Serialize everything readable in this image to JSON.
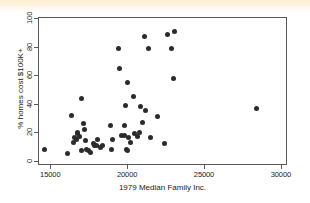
{
  "figure": {
    "background_color": "#ffffff",
    "frame_color": "#585858",
    "point_color": "#2b2b2b",
    "top_band_color": "#fdf0d2"
  },
  "chart_data": {
    "type": "scatter",
    "title": "",
    "xlabel": "1979 Median Family Inc.",
    "ylabel": "% homes cost $100K+",
    "xlim": [
      14200,
      30400
    ],
    "ylim": [
      -3,
      101
    ],
    "xticks": [
      15000,
      20000,
      25000,
      30000
    ],
    "xtick_labels": [
      "15000",
      "20000",
      "25000",
      "30000"
    ],
    "yticks": [
      0,
      20,
      40,
      60,
      80,
      100
    ],
    "ytick_labels": [
      "0",
      "20",
      "40",
      "60",
      "80",
      "100"
    ],
    "grid": false,
    "legend": "none",
    "marker": "filled-circle",
    "n_points": 51,
    "x": [
      14600,
      16100,
      16350,
      16500,
      16550,
      16700,
      16750,
      16800,
      16900,
      17000,
      17050,
      17150,
      17250,
      17300,
      17350,
      17500,
      17600,
      17800,
      17900,
      18000,
      18050,
      18250,
      18400,
      18900,
      19000,
      19050,
      19450,
      19500,
      19600,
      19800,
      19850,
      19900,
      19950,
      20000,
      20050,
      20100,
      20200,
      20400,
      20500,
      20700,
      20800,
      20900,
      21000,
      21100,
      21200,
      21400,
      21500,
      22000,
      22400,
      22600,
      22900,
      23000,
      23100,
      28400
    ],
    "y": [
      8,
      5,
      32,
      13,
      16,
      15,
      19,
      20,
      17,
      44,
      7,
      26,
      22,
      14,
      8,
      7,
      6,
      12,
      11,
      11,
      15,
      9,
      11,
      25,
      8,
      15,
      79,
      65,
      18,
      25,
      18,
      39,
      8,
      55,
      7,
      16,
      13,
      45,
      19,
      17,
      20,
      38,
      27,
      87,
      35,
      79,
      16,
      31,
      12,
      89,
      79,
      58,
      91,
      37
    ]
  }
}
